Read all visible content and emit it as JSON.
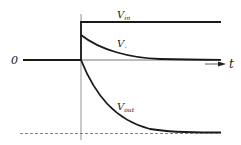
{
  "diagram": {
    "type": "step-response waveform",
    "zero_label": "0",
    "time_label": "t",
    "signals": [
      {
        "name": "V_in",
        "label_main": "V",
        "label_sub": "in",
        "behavior": "step up, constant"
      },
      {
        "name": "V_-",
        "label_main": "V",
        "label_sub": "–",
        "behavior": "jumps up then decays to 0"
      },
      {
        "name": "V_out",
        "label_main": "V",
        "label_sub": "out",
        "behavior": "decays negative to asymptote"
      }
    ],
    "asymptote": "dashed horizontal line (final V_out level)"
  },
  "colors": {
    "line": "#1a1a1a",
    "axis": "#555555",
    "dashed": "#666666",
    "background": "#ffffff"
  }
}
